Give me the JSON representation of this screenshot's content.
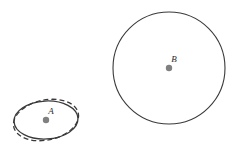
{
  "figure": {
    "background_color": "#ffffff",
    "width": 239,
    "height": 158,
    "stroke_color": "#3a3a3a",
    "dash_stroke_color": "#3a3a3a",
    "center_dot_color": "#808080",
    "label_color": "#2b2b2b",
    "objects": [
      {
        "id": "A",
        "label": "A",
        "type": "ellipse-pair",
        "center_x": 46,
        "center_y": 120,
        "solid": {
          "rx": 32,
          "ry": 19,
          "rotation_deg": -3,
          "style": "solid",
          "stroke_width": 1.3
        },
        "dashed": {
          "rx": 33,
          "ry": 20,
          "rotation_deg": -12,
          "style": "dashed",
          "dash_pattern": "5 3",
          "stroke_width": 1.3
        },
        "center_dot_radius": 3.2,
        "label_x": 51,
        "label_y": 114
      },
      {
        "id": "B",
        "label": "B",
        "type": "circle",
        "center_x": 169,
        "center_y": 68,
        "radius": 56,
        "style": "solid",
        "stroke_width": 1.1,
        "center_dot_radius": 3.2,
        "label_x": 174,
        "label_y": 62
      }
    ]
  }
}
